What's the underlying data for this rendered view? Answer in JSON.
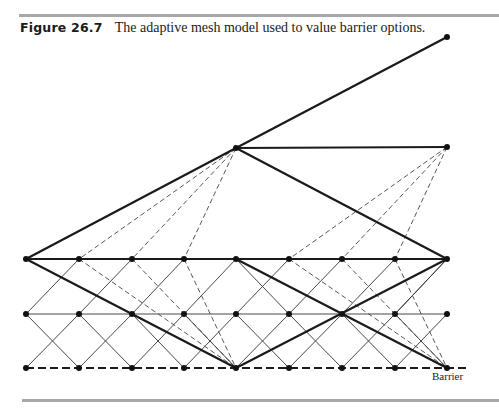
{
  "figure": {
    "number": "Figure 26.7",
    "caption": "The adaptive mesh model used to value barrier options.",
    "barrier_label": "Barrier"
  },
  "colors": {
    "rule": "#a8a8a8",
    "line": "#1a1a1a",
    "text": "#1a1a1a"
  },
  "mesh": {
    "coarse_nodes": [
      [
        26,
        259
      ],
      [
        236,
        148
      ],
      [
        236,
        259
      ],
      [
        236,
        368
      ],
      [
        447,
        37
      ],
      [
        447,
        147
      ],
      [
        447,
        259
      ],
      [
        447,
        368
      ]
    ],
    "fine_nodes": [
      [
        26,
        259
      ],
      [
        79,
        259
      ],
      [
        132,
        259
      ],
      [
        184,
        259
      ],
      [
        236,
        259
      ],
      [
        289,
        259
      ],
      [
        342,
        259
      ],
      [
        395,
        259
      ],
      [
        447,
        259
      ],
      [
        26,
        314
      ],
      [
        79,
        314
      ],
      [
        132,
        314
      ],
      [
        184,
        314
      ],
      [
        236,
        314
      ],
      [
        289,
        314
      ],
      [
        342,
        314
      ],
      [
        395,
        314
      ],
      [
        447,
        314
      ],
      [
        26,
        368
      ],
      [
        79,
        368
      ],
      [
        132,
        368
      ],
      [
        184,
        368
      ],
      [
        236,
        368
      ],
      [
        289,
        368
      ],
      [
        342,
        368
      ],
      [
        395,
        368
      ],
      [
        447,
        368
      ]
    ],
    "thick_lines": [
      [
        26,
        259,
        236,
        148
      ],
      [
        26,
        259,
        447,
        259
      ],
      [
        26,
        259,
        236,
        368
      ],
      [
        236,
        148,
        447,
        37
      ],
      [
        236,
        148,
        447,
        147
      ],
      [
        236,
        148,
        447,
        259
      ],
      [
        236,
        259,
        447,
        368
      ],
      [
        236,
        368,
        447,
        259
      ]
    ],
    "thin_lines": [
      [
        26,
        314,
        447,
        314
      ],
      [
        26,
        314,
        79,
        259
      ],
      [
        79,
        314,
        132,
        259
      ],
      [
        132,
        314,
        184,
        259
      ],
      [
        184,
        314,
        236,
        259
      ],
      [
        236,
        314,
        289,
        259
      ],
      [
        289,
        314,
        342,
        259
      ],
      [
        342,
        314,
        395,
        259
      ],
      [
        395,
        314,
        447,
        259
      ],
      [
        26,
        368,
        79,
        314
      ],
      [
        79,
        368,
        132,
        314
      ],
      [
        132,
        368,
        184,
        314
      ],
      [
        184,
        368,
        236,
        314
      ],
      [
        236,
        368,
        289,
        314
      ],
      [
        289,
        368,
        342,
        314
      ],
      [
        342,
        368,
        395,
        314
      ],
      [
        395,
        368,
        447,
        314
      ],
      [
        26,
        314,
        79,
        368
      ],
      [
        79,
        314,
        132,
        368
      ],
      [
        132,
        314,
        184,
        368
      ],
      [
        184,
        314,
        236,
        368
      ],
      [
        236,
        314,
        289,
        368
      ],
      [
        289,
        314,
        342,
        368
      ],
      [
        342,
        314,
        395,
        368
      ],
      [
        395,
        314,
        447,
        368
      ],
      [
        236,
        259,
        289,
        314
      ],
      [
        447,
        259,
        395,
        314
      ]
    ],
    "dashed_lines": [
      [
        236,
        148,
        79,
        259
      ],
      [
        236,
        148,
        132,
        259
      ],
      [
        236,
        148,
        184,
        259
      ],
      [
        447,
        147,
        289,
        259
      ],
      [
        447,
        147,
        342,
        259
      ],
      [
        447,
        147,
        395,
        259
      ],
      [
        79,
        259,
        236,
        368
      ],
      [
        132,
        259,
        236,
        368
      ],
      [
        184,
        259,
        236,
        368
      ],
      [
        289,
        259,
        447,
        368
      ],
      [
        342,
        259,
        447,
        368
      ],
      [
        395,
        259,
        447,
        368
      ]
    ],
    "barrier_line": [
      26,
      368,
      470,
      368
    ]
  }
}
